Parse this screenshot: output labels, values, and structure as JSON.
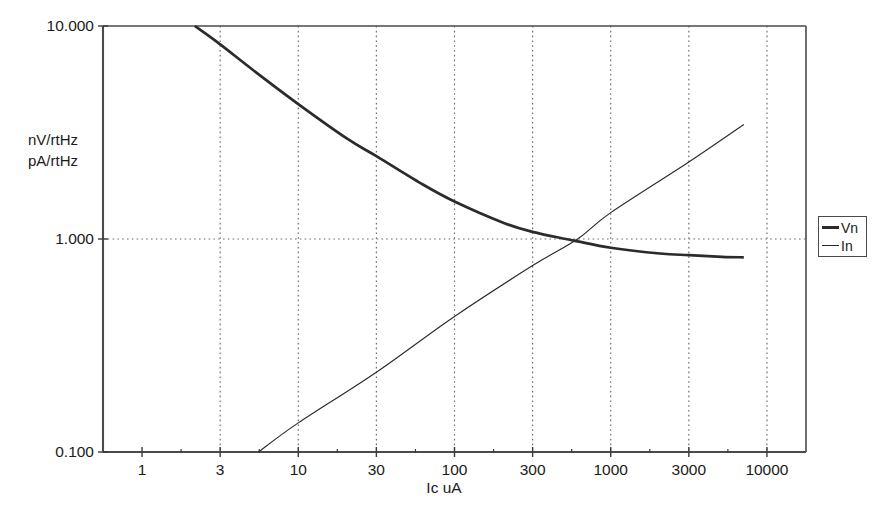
{
  "chart_data": {
    "type": "line",
    "title": "",
    "xlabel": "Ic uA",
    "ylabel_lines": [
      "nV/rtHz",
      "pA/rtHz"
    ],
    "xscale": "log",
    "yscale": "log",
    "xlim": [
      1,
      10000
    ],
    "ylim": [
      0.1,
      10.0
    ],
    "grid": "dotted",
    "legend_position": "right-outside",
    "x_tick_labels": [
      "1",
      "3",
      "10",
      "30",
      "100",
      "300",
      "1000",
      "3000",
      "10000"
    ],
    "x_tick_values": [
      1,
      3,
      10,
      30,
      100,
      300,
      1000,
      3000,
      10000
    ],
    "y_tick_labels": [
      "10.000",
      "1.000",
      "0.100"
    ],
    "y_tick_values": [
      10.0,
      1.0,
      0.1
    ],
    "series": [
      {
        "name": "Vn",
        "style": "thick",
        "x": [
          2.1,
          3,
          5,
          10,
          20,
          30,
          60,
          100,
          200,
          300,
          500,
          600,
          1000,
          2000,
          3000,
          5000,
          7000
        ],
        "y": [
          10.0,
          8.2,
          6.2,
          4.3,
          2.95,
          2.45,
          1.82,
          1.5,
          1.19,
          1.08,
          1.0,
          0.975,
          0.91,
          0.855,
          0.84,
          0.825,
          0.82
        ]
      },
      {
        "name": "In",
        "style": "thin",
        "x": [
          5.4,
          10,
          30,
          100,
          300,
          600,
          1000,
          3000,
          7000
        ],
        "y": [
          0.1,
          0.137,
          0.237,
          0.433,
          0.75,
          1.0,
          1.33,
          2.3,
          3.45
        ]
      }
    ],
    "annotations": [
      {
        "text": "Vn and In curves cross at approximately Ic = 600 uA, 1.000"
      }
    ],
    "colors": {
      "axis": "#4a4a4a",
      "grid": "#6e6e6e",
      "series_vn": "#2b2b2b",
      "series_in": "#2b2b2b",
      "background": "#ffffff",
      "text": "#1a1a1a"
    }
  },
  "legend": {
    "entries": [
      {
        "label": "Vn"
      },
      {
        "label": "In"
      }
    ]
  }
}
